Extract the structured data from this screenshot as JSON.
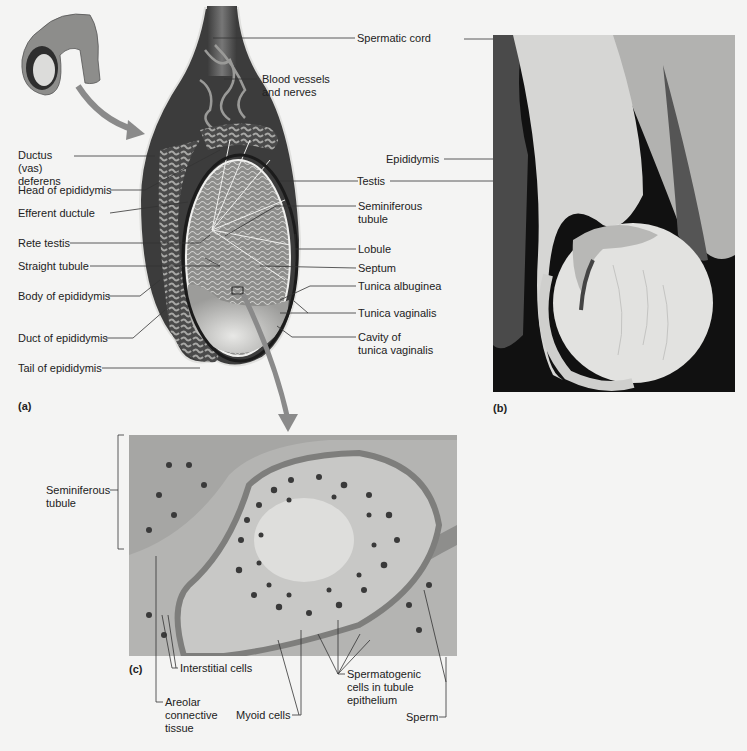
{
  "figure": {
    "panels": {
      "a": {
        "tag": "(a)",
        "description": "Sagittal section illustration of testis and epididymis",
        "labels_left": [
          {
            "id": "ductus-deferens",
            "text": "Ductus (vas) deferens",
            "line1": "Ductus (vas)",
            "line2": "deferens"
          },
          {
            "id": "head-epididymis",
            "text": "Head of epididymis"
          },
          {
            "id": "efferent-ductule",
            "text": "Efferent ductule"
          },
          {
            "id": "rete-testis",
            "text": "Rete testis"
          },
          {
            "id": "straight-tubule",
            "text": "Straight tubule"
          },
          {
            "id": "body-epididymis",
            "text": "Body of epididymis"
          },
          {
            "id": "duct-epididymis",
            "text": "Duct of epididymis"
          },
          {
            "id": "tail-epididymis",
            "text": "Tail of epididymis"
          }
        ],
        "labels_right": [
          {
            "id": "spermatic-cord",
            "text": "Spermatic cord"
          },
          {
            "id": "blood-vessels",
            "text": "Blood vessels and nerves",
            "line1": "Blood vessels",
            "line2": "and nerves"
          },
          {
            "id": "testis",
            "text": "Testis"
          },
          {
            "id": "seminiferous-tubule",
            "text": "Seminiferous tubule",
            "line1": "Seminiferous",
            "line2": "tubule"
          },
          {
            "id": "lobule",
            "text": "Lobule"
          },
          {
            "id": "septum",
            "text": "Septum"
          },
          {
            "id": "tunica-albuginea",
            "text": "Tunica albuginea"
          },
          {
            "id": "tunica-vaginalis",
            "text": "Tunica vaginalis"
          },
          {
            "id": "cavity-tunica-vaginalis",
            "text": "Cavity of tunica vaginalis",
            "line1": "Cavity of",
            "line2": "tunica vaginalis"
          }
        ]
      },
      "b": {
        "tag": "(b)",
        "description": "Photograph of dissected testis",
        "labels": [
          {
            "id": "epididymis",
            "text": "Epididymis"
          }
        ]
      },
      "c": {
        "tag": "(c)",
        "description": "Light micrograph of seminiferous tubule cross section",
        "labels": [
          {
            "id": "c-seminiferous-tubule",
            "text": "Seminiferous tubule",
            "line1": "Seminiferous",
            "line2": "tubule"
          },
          {
            "id": "interstitial-cells",
            "text": "Interstitial cells"
          },
          {
            "id": "areolar-connective-tissue",
            "text": "Areolar connective tissue",
            "line1": "Areolar",
            "line2": "connective",
            "line3": "tissue"
          },
          {
            "id": "myoid-cells",
            "text": "Myoid cells"
          },
          {
            "id": "spermatogenic-cells",
            "text": "Spermatogenic cells in tubule epithelium",
            "line1": "Spermatogenic",
            "line2": "cells in tubule",
            "line3": "epithelium"
          },
          {
            "id": "sperm",
            "text": "Sperm"
          }
        ]
      }
    },
    "colors": {
      "background": "#f4f4f3",
      "label_text": "#222222",
      "leader_line": "#333333",
      "arrow": "#8a8a8a",
      "photo_bg": "#0f0f0f",
      "micro_bg": "#b9b9b7"
    }
  }
}
